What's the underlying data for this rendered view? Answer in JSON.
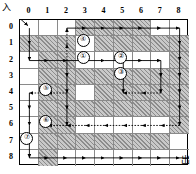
{
  "figure": {
    "kind": "maze-grid-diagram",
    "entrance_label": "入",
    "exit_label": "出",
    "grid_size": 9,
    "col_labels": [
      "0",
      "1",
      "2",
      "3",
      "4",
      "5",
      "6",
      "7",
      "8"
    ],
    "row_labels": [
      "0",
      "1",
      "2",
      "3",
      "4",
      "5",
      "6",
      "7",
      "8"
    ],
    "colors": {
      "wall_fill": "#c9c9c9",
      "hatch": "#000000",
      "open_fill": "#ffffff",
      "grid_line": "#8a8a8a",
      "border": "#000000",
      "arrow": "#000000"
    },
    "entrance_cell": [
      0,
      0
    ],
    "exit_cell": [
      8,
      8
    ],
    "step_badges": [
      {
        "label": "①",
        "col": 3,
        "row": 2
      },
      {
        "label": "②",
        "col": 5,
        "row": 2
      },
      {
        "label": "③",
        "col": 5,
        "row": 3
      },
      {
        "label": "④",
        "col": 3,
        "row": 1
      },
      {
        "label": "⑤",
        "col": 1,
        "row": 4
      },
      {
        "label": "⑥",
        "col": 1,
        "row": 6
      },
      {
        "label": "⑦",
        "col": 0,
        "row": 7
      }
    ],
    "walls": [
      [
        0,
        1
      ],
      [
        1,
        1
      ],
      [
        1,
        2
      ],
      [
        1,
        3
      ],
      [
        1,
        4
      ],
      [
        1,
        5
      ],
      [
        1,
        6
      ],
      [
        1,
        7
      ],
      [
        1,
        8
      ],
      [
        2,
        3
      ],
      [
        2,
        5
      ],
      [
        2,
        7
      ],
      [
        3,
        0
      ],
      [
        3,
        3
      ],
      [
        3,
        5
      ],
      [
        3,
        7
      ],
      [
        4,
        1
      ],
      [
        4,
        3
      ],
      [
        4,
        4
      ],
      [
        4,
        5
      ],
      [
        4,
        7
      ],
      [
        5,
        1
      ],
      [
        5,
        3
      ],
      [
        5,
        4
      ],
      [
        5,
        5
      ],
      [
        5,
        7
      ],
      [
        6,
        1
      ],
      [
        6,
        3
      ],
      [
        6,
        4
      ],
      [
        6,
        5
      ],
      [
        6,
        7
      ],
      [
        7,
        1
      ],
      [
        7,
        3
      ],
      [
        7,
        4
      ],
      [
        7,
        5
      ],
      [
        7,
        7
      ],
      [
        2,
        1
      ],
      [
        2,
        2
      ],
      [
        2,
        4
      ],
      [
        2,
        6
      ],
      [
        6,
        0
      ],
      [
        4,
        0
      ],
      [
        5,
        0
      ],
      [
        8,
        1
      ],
      [
        8,
        2
      ],
      [
        8,
        3
      ],
      [
        8,
        4
      ],
      [
        8,
        5
      ],
      [
        8,
        6
      ]
    ],
    "arrows": {
      "description": "Directed search path through the maze (rightward, downward, leftward and upward probe arrows forming a depth-first traversal trace)",
      "segments": [
        {
          "from": [
            0,
            0
          ],
          "to": [
            0,
            0
          ],
          "dir": "down-right",
          "note": "entrance arrow into cell (0,0)"
        },
        {
          "from": [
            0,
            0
          ],
          "to": [
            0,
            2
          ],
          "dir": "down"
        },
        {
          "from": [
            0,
            2
          ],
          "to": [
            2,
            2
          ],
          "dir": "right"
        },
        {
          "from": [
            2,
            2
          ],
          "to": [
            2,
            0
          ],
          "dir": "up"
        },
        {
          "from": [
            2,
            0
          ],
          "to": [
            8,
            0
          ],
          "dir": "right"
        },
        {
          "from": [
            8,
            0
          ],
          "to": [
            8,
            2
          ],
          "dir": "down"
        },
        {
          "from": [
            2,
            2
          ],
          "to": [
            5,
            2
          ],
          "dir": "right"
        },
        {
          "from": [
            5,
            2
          ],
          "to": [
            5,
            4
          ],
          "dir": "down"
        },
        {
          "from": [
            5,
            2
          ],
          "to": [
            7,
            2
          ],
          "dir": "right"
        },
        {
          "from": [
            7,
            2
          ],
          "to": [
            7,
            4
          ],
          "dir": "down"
        },
        {
          "from": [
            7,
            4
          ],
          "to": [
            5,
            4
          ],
          "dir": "left"
        },
        {
          "from": [
            8,
            2
          ],
          "to": [
            8,
            6
          ],
          "dir": "down"
        },
        {
          "from": [
            2,
            4
          ],
          "to": [
            1,
            4
          ],
          "dir": "left"
        },
        {
          "from": [
            1,
            4
          ],
          "to": [
            0,
            4
          ],
          "dir": "left"
        },
        {
          "from": [
            0,
            4
          ],
          "to": [
            0,
            6
          ],
          "dir": "down"
        },
        {
          "from": [
            2,
            2
          ],
          "to": [
            2,
            6
          ],
          "dir": "down"
        },
        {
          "from": [
            8,
            6
          ],
          "to": [
            1,
            6
          ],
          "dir": "left"
        },
        {
          "from": [
            0,
            6
          ],
          "to": [
            0,
            8
          ],
          "dir": "down"
        },
        {
          "from": [
            0,
            8
          ],
          "to": [
            8,
            8
          ],
          "dir": "right"
        },
        {
          "from": [
            8,
            8
          ],
          "to": [
            8,
            8
          ],
          "dir": "right",
          "note": "exit arrow out of cell (8,8)"
        }
      ]
    }
  }
}
